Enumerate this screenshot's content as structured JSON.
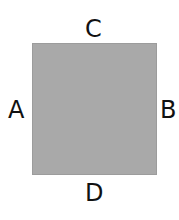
{
  "diagram": {
    "shape": "square",
    "fill_color": "#a9a9a9",
    "labels": {
      "top": "C",
      "left": "A",
      "right": "B",
      "bottom": "D"
    }
  }
}
